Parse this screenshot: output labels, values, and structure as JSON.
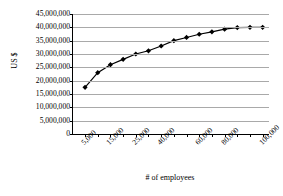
{
  "chart_data": {
    "type": "line",
    "title": "",
    "xlabel": "# of employees",
    "ylabel": "US $",
    "ylim": [
      0,
      45000000
    ],
    "ytick_labels": [
      "45,000,000",
      "40,000,000",
      "35,000,000",
      "30,000,000",
      "25,000,000",
      "20,000,000",
      "15,000,000",
      "10,000,000",
      "5,000,000",
      "0"
    ],
    "ytick_values": [
      45000000,
      40000000,
      35000000,
      30000000,
      25000000,
      20000000,
      15000000,
      10000000,
      5000000,
      0
    ],
    "xtick_labels": [
      "5,000",
      "15,000",
      "25,000",
      "40,000",
      "60,000",
      "80,000",
      "100,000"
    ],
    "grid": true,
    "legend": "none",
    "marker": "diamond",
    "line_color": "#000000",
    "marker_color": "#000000",
    "grid_color": "#a9a9a9",
    "categories": [
      "5,000",
      "10,000",
      "15,000",
      "20,000",
      "25,000",
      "30,000",
      "40,000",
      "45,000",
      "50,000",
      "60,000",
      "70,000",
      "80,000",
      "90,000",
      "95,000",
      "100,000"
    ],
    "values": [
      17500000,
      23000000,
      26000000,
      28000000,
      30000000,
      31200000,
      33000000,
      35000000,
      36200000,
      37400000,
      38300000,
      39300000,
      39900000,
      40000000,
      40000000
    ]
  }
}
